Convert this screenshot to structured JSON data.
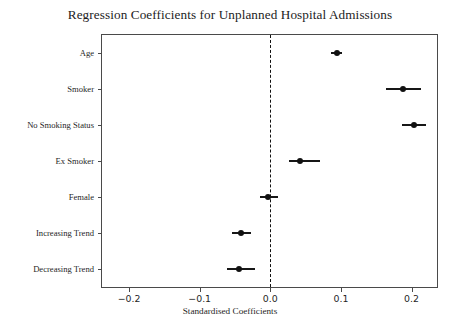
{
  "chart_data": {
    "type": "scatter",
    "title": "Regression Coefficients for Unplanned Hospital Admissions",
    "subtitle": "",
    "xlabel": "Standardised Coefficients",
    "ylabel": "",
    "orientation": "horizontal",
    "grid": false,
    "legend": "none",
    "xlim": [
      -0.2384,
      0.2361
    ],
    "xticks": [
      -0.2,
      -0.1,
      0.0,
      0.1,
      0.2
    ],
    "xtick_labels": [
      "−0.2",
      "−0.1",
      "0.0",
      "0.1",
      "0.2"
    ],
    "reference_line": {
      "value": 0.0,
      "style": "dashed",
      "color": "#111111"
    },
    "marker_color": "#111111",
    "categories": [
      "Age",
      "Smoker",
      "No Smoking Status",
      "Ex Smoker",
      "Female",
      "Increasing Trend",
      "Decreasing Trend"
    ],
    "values": [
      0.094,
      0.188,
      0.204,
      0.042,
      -0.003,
      -0.042,
      -0.044
    ],
    "ci_low": [
      0.086,
      0.164,
      0.186,
      0.026,
      -0.015,
      -0.054,
      -0.062
    ],
    "ci_high": [
      0.101,
      0.213,
      0.221,
      0.07,
      0.011,
      -0.028,
      -0.022
    ],
    "points": [
      {
        "label": "Age",
        "value": 0.094,
        "ci_low": 0.086,
        "ci_high": 0.101
      },
      {
        "label": "Smoker",
        "value": 0.188,
        "ci_low": 0.164,
        "ci_high": 0.213
      },
      {
        "label": "No Smoking Status",
        "value": 0.204,
        "ci_low": 0.186,
        "ci_high": 0.221
      },
      {
        "label": "Ex Smoker",
        "value": 0.042,
        "ci_low": 0.026,
        "ci_high": 0.07
      },
      {
        "label": "Female",
        "value": -0.003,
        "ci_low": -0.015,
        "ci_high": 0.011
      },
      {
        "label": "Increasing Trend",
        "value": -0.042,
        "ci_low": -0.054,
        "ci_high": -0.028
      },
      {
        "label": "Decreasing Trend",
        "value": -0.044,
        "ci_low": -0.062,
        "ci_high": -0.022
      }
    ]
  }
}
